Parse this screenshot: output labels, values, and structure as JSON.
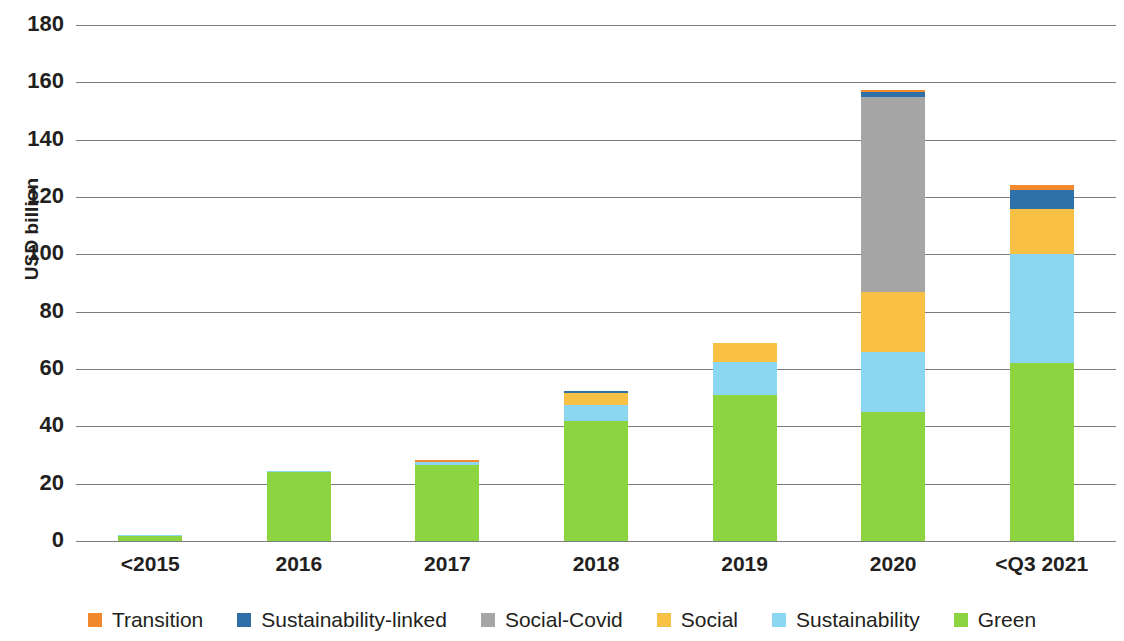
{
  "chart_data": {
    "type": "bar",
    "stacked": true,
    "title": "",
    "subtitle": "",
    "xlabel": "",
    "ylabel": "USD billion",
    "ylim": [
      0,
      180
    ],
    "ytick_step": 20,
    "yticks": [
      "180",
      "160",
      "140",
      "120",
      "100",
      "80",
      "60",
      "40",
      "20",
      "0"
    ],
    "grid": true,
    "legend_position": "bottom",
    "categories": [
      "<2015",
      "2016",
      "2017",
      "2018",
      "2019",
      "2020",
      "<Q3 2021"
    ],
    "series": [
      {
        "name": "Green",
        "color": "#8DD441",
        "values": [
          1.8,
          24.2,
          26.5,
          42.0,
          51.0,
          45.0,
          62.0
        ]
      },
      {
        "name": "Sustainability",
        "color": "#8BD6F0",
        "values": [
          0.3,
          0.3,
          1.0,
          5.5,
          11.5,
          21.0,
          38.0
        ]
      },
      {
        "name": "Social",
        "color": "#F9C046",
        "values": [
          0.0,
          0.0,
          0.0,
          4.3,
          6.7,
          21.0,
          16.0
        ]
      },
      {
        "name": "Social-Covid",
        "color": "#A6A6A6",
        "values": [
          0.0,
          0.0,
          0.0,
          0.0,
          0.0,
          68.0,
          0.0
        ]
      },
      {
        "name": "Sustainability-linked",
        "color": "#2E71A8",
        "values": [
          0.0,
          0.0,
          0.0,
          0.5,
          0.0,
          1.5,
          6.5
        ]
      },
      {
        "name": "Transition",
        "color": "#F2892E",
        "values": [
          0.0,
          0.0,
          0.6,
          0.0,
          0.0,
          0.8,
          1.8
        ]
      }
    ],
    "totals": [
      2.1,
      24.5,
      28.1,
      52.3,
      69.2,
      157.3,
      124.3
    ]
  },
  "legend": {
    "items": [
      {
        "label": "Transition",
        "color": "#F2892E"
      },
      {
        "label": "Sustainability-linked",
        "color": "#2E71A8"
      },
      {
        "label": "Social-Covid",
        "color": "#A6A6A6"
      },
      {
        "label": "Social",
        "color": "#F9C046"
      },
      {
        "label": "Sustainability",
        "color": "#8BD6F0"
      },
      {
        "label": "Green",
        "color": "#8DD441"
      }
    ]
  }
}
